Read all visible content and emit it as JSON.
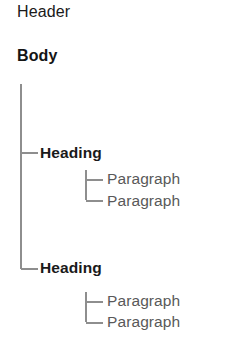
{
  "diagram": {
    "type": "tree",
    "colors": {
      "background": "#ffffff",
      "heading_text": "#1a1a1a",
      "body_text": "#151515",
      "paragraph_text": "#595959",
      "connector_line": "#8e8e8e"
    },
    "top_level": {
      "header_label": "Header",
      "body_label": "Body"
    },
    "nodes": [
      {
        "label": "Heading",
        "level": 1,
        "connector": "tee",
        "children": [
          {
            "label": "Paragraph",
            "level": 2,
            "connector": "tee"
          },
          {
            "label": "Paragraph",
            "level": 2,
            "connector": "elbow"
          }
        ]
      },
      {
        "label": "Heading",
        "level": 1,
        "connector": "elbow",
        "children": [
          {
            "label": "Paragraph",
            "level": 2,
            "connector": "tee"
          },
          {
            "label": "Paragraph",
            "level": 2,
            "connector": "elbow"
          }
        ]
      }
    ]
  }
}
